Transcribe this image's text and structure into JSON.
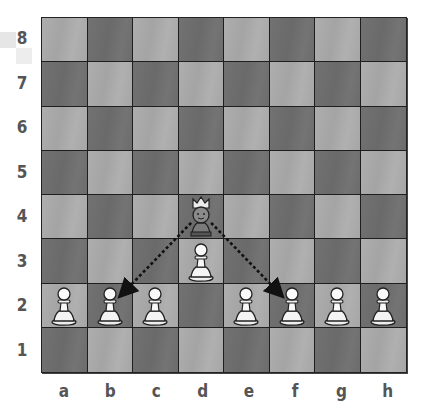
{
  "board": {
    "files": [
      "a",
      "b",
      "c",
      "d",
      "e",
      "f",
      "g",
      "h"
    ],
    "ranks": [
      "8",
      "7",
      "6",
      "5",
      "4",
      "3",
      "2",
      "1"
    ],
    "colors": {
      "light": "#a8a8a8",
      "dark": "#6e6e6e",
      "border": "#222222"
    },
    "pieces": [
      {
        "square": "a2",
        "type": "pawn",
        "color": "white"
      },
      {
        "square": "b2",
        "type": "pawn",
        "color": "white"
      },
      {
        "square": "c2",
        "type": "pawn",
        "color": "white"
      },
      {
        "square": "e2",
        "type": "pawn",
        "color": "white"
      },
      {
        "square": "f2",
        "type": "pawn",
        "color": "white"
      },
      {
        "square": "g2",
        "type": "pawn",
        "color": "white"
      },
      {
        "square": "h2",
        "type": "pawn",
        "color": "white"
      },
      {
        "square": "d3",
        "type": "pawn",
        "color": "white"
      },
      {
        "square": "d4",
        "type": "queen-character",
        "color": "black"
      }
    ],
    "arrows": [
      {
        "from": "d4",
        "to": "b2",
        "style": "dotted"
      },
      {
        "from": "d4",
        "to": "f2",
        "style": "dotted"
      }
    ]
  }
}
